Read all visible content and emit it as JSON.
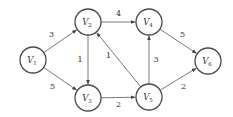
{
  "diagram": {
    "type": "directed-weighted-graph",
    "nodes": [
      {
        "id": "v1",
        "label": "V",
        "sub": "1"
      },
      {
        "id": "v2",
        "label": "V",
        "sub": "2"
      },
      {
        "id": "v3",
        "label": "V",
        "sub": "3"
      },
      {
        "id": "v4",
        "label": "V",
        "sub": "4"
      },
      {
        "id": "v5",
        "label": "V",
        "sub": "5"
      },
      {
        "id": "v6",
        "label": "V",
        "sub": "6"
      }
    ],
    "edges": [
      {
        "from": "v1",
        "to": "v2",
        "weight": "3"
      },
      {
        "from": "v1",
        "to": "v3",
        "weight": "5"
      },
      {
        "from": "v2",
        "to": "v3",
        "weight": "1"
      },
      {
        "from": "v2",
        "to": "v4",
        "weight": "4"
      },
      {
        "from": "v3",
        "to": "v5",
        "weight": "2"
      },
      {
        "from": "v5",
        "to": "v2",
        "weight": "1"
      },
      {
        "from": "v5",
        "to": "v4",
        "weight": "3"
      },
      {
        "from": "v4",
        "to": "v6",
        "weight": "5"
      },
      {
        "from": "v5",
        "to": "v6",
        "weight": "2"
      }
    ],
    "colors": {
      "stroke": "#4a4a4a",
      "text": "#333333",
      "background": "#ffffff"
    }
  }
}
